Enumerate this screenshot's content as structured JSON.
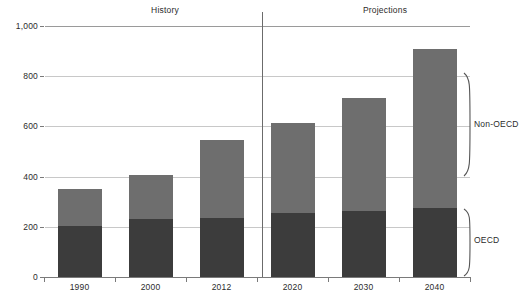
{
  "chart_data": {
    "type": "bar",
    "stacked": true,
    "title": "",
    "subtitle": "",
    "xlabel": "",
    "ylabel": "",
    "categories": [
      "1990",
      "2000",
      "2012",
      "2020",
      "2030",
      "2040"
    ],
    "series": [
      {
        "name": "OECD",
        "values": [
          203,
          230,
          235,
          255,
          265,
          275
        ],
        "color": "#3c3c3c"
      },
      {
        "name": "Non-OECD",
        "values": [
          147,
          175,
          310,
          360,
          450,
          635
        ],
        "color": "#6e6e6e"
      }
    ],
    "totals": [
      350,
      405,
      545,
      615,
      715,
      910
    ],
    "ylim": [
      0,
      1000
    ],
    "yticks": [
      0,
      200,
      400,
      600,
      800,
      1000
    ],
    "ytick_labels": [
      "0",
      "200",
      "400",
      "600",
      "800",
      "1,000"
    ],
    "grid": true,
    "legend_position": "right-inline-braces",
    "annotations": [
      {
        "name": "history",
        "label": "History",
        "spans": [
          "1990",
          "2000",
          "2012"
        ]
      },
      {
        "name": "projections",
        "label": "Projections",
        "spans": [
          "2020",
          "2030",
          "2040"
        ]
      },
      {
        "name": "divider",
        "label": "",
        "between": [
          "2012",
          "2020"
        ]
      }
    ]
  },
  "axes": {
    "y": {
      "ticks": [
        {
          "value": 1000,
          "label": "1,000"
        },
        {
          "value": 800,
          "label": "800"
        },
        {
          "value": 600,
          "label": "600"
        },
        {
          "value": 400,
          "label": "400"
        },
        {
          "value": 200,
          "label": "200"
        },
        {
          "value": 0,
          "label": "0"
        }
      ]
    },
    "x": {
      "ticks": [
        {
          "label": "1990"
        },
        {
          "label": "2000"
        },
        {
          "label": "2012"
        },
        {
          "label": "2020"
        },
        {
          "label": "2030"
        },
        {
          "label": "2040"
        }
      ]
    }
  },
  "sections": {
    "history_label": "History",
    "projections_label": "Projections"
  },
  "legend": {
    "non_oecd_label": "Non-OECD",
    "oecd_label": "OECD"
  },
  "colors": {
    "oecd": "#3c3c3c",
    "non_oecd": "#6e6e6e",
    "grid": "#c8c8c8",
    "axis": "#7a7a7a",
    "text": "#2b2b2b",
    "background": "#ffffff"
  }
}
